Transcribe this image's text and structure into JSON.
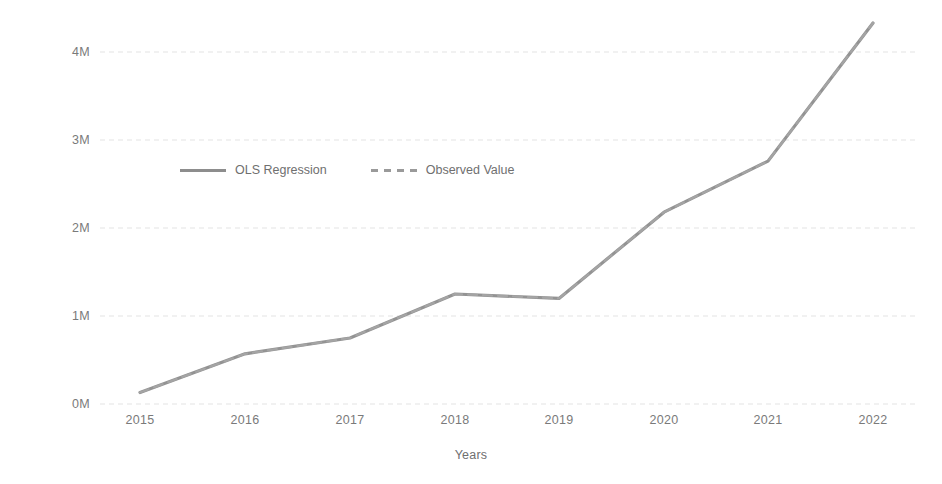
{
  "chart_data": {
    "type": "line",
    "title": "",
    "xlabel": "Years",
    "ylabel": "Purchased PPAs (MWh)",
    "categories": [
      "2015",
      "2016",
      "2017",
      "2018",
      "2019",
      "2020",
      "2021",
      "2022"
    ],
    "x": [
      2015,
      2016,
      2017,
      2018,
      2019,
      2020,
      2021,
      2022
    ],
    "series": [
      {
        "name": "OLS Regression",
        "style": "solid",
        "color": "#8d8d8d",
        "values": [
          130000,
          570000,
          750000,
          1250000,
          1200000,
          2180000,
          2760000,
          4330000
        ]
      },
      {
        "name": "Observed Value",
        "style": "dashed",
        "color": "#a6a6a6",
        "values": [
          130000,
          570000,
          750000,
          1250000,
          1200000,
          2180000,
          2760000,
          4330000
        ]
      }
    ],
    "ylim": [
      0,
      4500000
    ],
    "yticks": [
      0,
      1000000,
      2000000,
      3000000,
      4000000
    ],
    "ytick_labels": [
      "0M",
      "1M",
      "2M",
      "3M",
      "4M"
    ],
    "xtick_labels": [
      "2015",
      "2016",
      "2017",
      "2018",
      "2019",
      "2020",
      "2021",
      "2022"
    ],
    "grid": true,
    "grid_axis": "y",
    "legend_position": "upper-left-inside",
    "background": "#ffffff"
  },
  "legend": {
    "items": [
      {
        "label": "OLS Regression",
        "style": "solid"
      },
      {
        "label": "Observed Value",
        "style": "dashed"
      }
    ]
  },
  "axes": {
    "y_title": "Purchased PPAs (MWh)",
    "x_title": "Years",
    "y_ticks": [
      {
        "label": "4M",
        "py": 52
      },
      {
        "label": "3M",
        "py": 140
      },
      {
        "label": "2M",
        "py": 228
      },
      {
        "label": "1M",
        "py": 316
      },
      {
        "label": "0M",
        "py": 404
      }
    ],
    "x_ticks": [
      {
        "label": "2015",
        "px": 140
      },
      {
        "label": "2016",
        "px": 245
      },
      {
        "label": "2017",
        "px": 350
      },
      {
        "label": "2018",
        "px": 455
      },
      {
        "label": "2019",
        "px": 559
      },
      {
        "label": "2020",
        "px": 664
      },
      {
        "label": "2021",
        "px": 768
      },
      {
        "label": "2022",
        "px": 873
      }
    ]
  }
}
